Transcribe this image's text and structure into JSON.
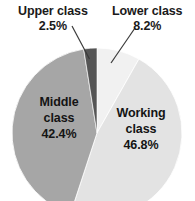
{
  "chart_data": {
    "type": "pie",
    "title": "",
    "subtitle": "",
    "xlabel": "",
    "ylabel": "",
    "legend_position": "none",
    "grid": false,
    "units": "percent",
    "start_angle_deg": 0,
    "direction": "clockwise",
    "categories": [
      "Lower class",
      "Working class",
      "Middle class",
      "Upper class"
    ],
    "values": [
      8.2,
      46.8,
      42.4,
      2.5
    ],
    "slices": [
      {
        "name": "Lower class",
        "value": 8.2,
        "value_label": "8.2%",
        "color": "#f1f1f1",
        "label_placement": "outside",
        "leader_line": true
      },
      {
        "name": "Working class",
        "value": 46.8,
        "value_label": "46.8%",
        "color": "#e3e3e3",
        "label_placement": "inside",
        "leader_line": false
      },
      {
        "name": "Middle class",
        "value": 42.4,
        "value_label": "42.4%",
        "color": "#a6a6a6",
        "label_placement": "inside",
        "leader_line": false
      },
      {
        "name": "Upper class",
        "value": 2.5,
        "value_label": "2.5%",
        "color": "#555555",
        "label_placement": "outside",
        "leader_line": true
      }
    ]
  },
  "labels": {
    "upper": {
      "name": "Upper class",
      "value": "2.5%"
    },
    "lower": {
      "name": "Lower class",
      "value": "8.2%"
    },
    "middle": {
      "name_line1": "Middle",
      "name_line2": "class",
      "value": "42.4%"
    },
    "working": {
      "name_line1": "Working",
      "name_line2": "class",
      "value": "46.8%"
    }
  },
  "style": {
    "background": "#ffffff",
    "text_color": "#1a1a1a",
    "leader_line_color": "#3a3a3a",
    "slice_edge_color": "#ffffff"
  }
}
